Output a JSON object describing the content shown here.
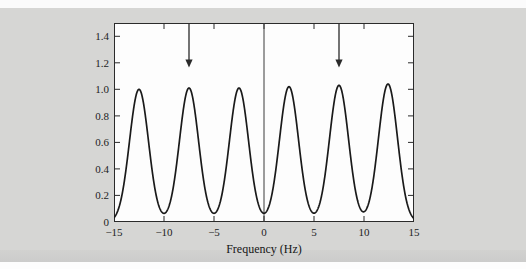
{
  "figure": {
    "background_color": "#d6d6d4",
    "plot_background_color": "#fdfdfd",
    "axis_color": "#2b2b2b",
    "curve_color": "#1a1a1a",
    "arrow_color": "#2a2a2a",
    "top_ghost_text": "",
    "xlabel": "Frequency (Hz)",
    "ylabel": ""
  },
  "chart_data": {
    "type": "line",
    "title": "",
    "xlabel": "Frequency (Hz)",
    "ylabel": "",
    "xlim": [
      -15,
      15
    ],
    "ylim": [
      0,
      1.5
    ],
    "grid": false,
    "legend": null,
    "xticks": [
      -15,
      -10,
      -5,
      0,
      5,
      10,
      15
    ],
    "xticklabels": [
      "−15",
      "−10",
      "−5",
      "0",
      "5",
      "10",
      "15"
    ],
    "yticks": [
      0,
      0.2,
      0.4,
      0.6,
      0.8,
      1.0,
      1.2,
      1.4
    ],
    "yticklabels": [
      "0",
      "0.2",
      "0.4",
      "0.6",
      "0.8",
      "1.0",
      "1.2",
      "1.4"
    ],
    "series": [
      {
        "name": "spectrum",
        "peaks": [
          {
            "center": -12.5,
            "amplitude": 1.0,
            "width": 1.35
          },
          {
            "center": -7.5,
            "amplitude": 1.01,
            "width": 1.35
          },
          {
            "center": -2.5,
            "amplitude": 1.01,
            "width": 1.35
          },
          {
            "center": 2.5,
            "amplitude": 1.02,
            "width": 1.35
          },
          {
            "center": 7.5,
            "amplitude": 1.03,
            "width": 1.35
          },
          {
            "center": 12.4,
            "amplitude": 1.04,
            "width": 1.35
          }
        ]
      }
    ],
    "annotations": [
      {
        "name": "arrow-left",
        "type": "down-arrow",
        "x": -7.5,
        "y_top": 1.5,
        "y_tip": 1.18
      },
      {
        "name": "arrow-right",
        "type": "down-arrow",
        "x": 7.5,
        "y_top": 1.5,
        "y_tip": 1.18
      },
      {
        "name": "zero-line",
        "type": "vertical-line",
        "x": 0,
        "y_from": 0,
        "y_to": 1.5
      }
    ]
  }
}
